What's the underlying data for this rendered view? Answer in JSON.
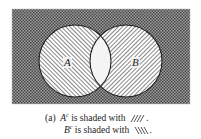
{
  "diagram": {
    "type": "venn",
    "universe": {
      "x": 12,
      "y": 9,
      "width": 178,
      "height": 95,
      "fill": "crosshatch"
    },
    "sets": [
      {
        "name": "A",
        "label": "A",
        "cx": 75,
        "cy": 61,
        "r": 36,
        "fill_hatch": "backslash"
      },
      {
        "name": "B",
        "label": "B",
        "cx": 126,
        "cy": 61,
        "r": 36,
        "fill_hatch": "forwardslash"
      }
    ],
    "intersection_fill": "white",
    "colors": {
      "hatch": "#555555",
      "stroke": "#222222",
      "background": "#ffffff"
    }
  },
  "caption": {
    "marker": "(a)",
    "line1": {
      "set": "A",
      "sup": "c",
      "text": " is shaded with",
      "swatch": "////",
      "end": "."
    },
    "line2": {
      "set": "B",
      "sup": "c",
      "text": " is shaded with",
      "swatch": "\\\\\\\\",
      "end": "."
    }
  }
}
